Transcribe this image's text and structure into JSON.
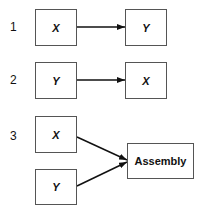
{
  "diagram": {
    "rows": [
      {
        "number": "1",
        "left": "X",
        "right": "Y"
      },
      {
        "number": "2",
        "left": "Y",
        "right": "X"
      },
      {
        "number": "3",
        "top": "X",
        "bottom": "Y",
        "target": "Assembly"
      }
    ]
  }
}
